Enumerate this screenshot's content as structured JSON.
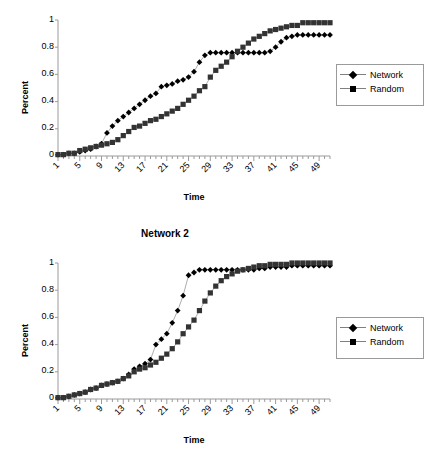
{
  "figure": {
    "background": "#ffffff",
    "caption": ""
  },
  "common": {
    "xlabel": "Time",
    "ylabel": "Percent",
    "ytick_labels": [
      "0",
      "0.2",
      "0.4",
      "0.6",
      "0.8",
      "1"
    ],
    "xtick_labels": [
      "1",
      "5",
      "9",
      "13",
      "17",
      "21",
      "25",
      "29",
      "33",
      "37",
      "41",
      "45",
      "49"
    ],
    "legend": {
      "entries": [
        {
          "label": "Network",
          "marker": "diamond",
          "color": "#000000"
        },
        {
          "label": "Random",
          "marker": "square",
          "color": "#333333"
        }
      ]
    }
  },
  "chart_data": [
    {
      "id": "chart1",
      "type": "line",
      "title": "",
      "xlabel": "Time",
      "ylabel": "Percent",
      "xlim": [
        1,
        51
      ],
      "ylim": [
        0,
        1
      ],
      "ytick_labels": [
        "0",
        "0.2",
        "0.4",
        "0.6",
        "0.8",
        "1"
      ],
      "yticks": [
        0,
        0.2,
        0.4,
        0.6,
        0.8,
        1
      ],
      "xtick_labels": [
        "1",
        "5",
        "9",
        "13",
        "17",
        "21",
        "25",
        "29",
        "33",
        "37",
        "41",
        "45",
        "49"
      ],
      "xticks": [
        1,
        5,
        9,
        13,
        17,
        21,
        25,
        29,
        33,
        37,
        41,
        45,
        49
      ],
      "grid": false,
      "legend_position": "right",
      "x": [
        1,
        2,
        3,
        4,
        5,
        6,
        7,
        8,
        9,
        10,
        11,
        12,
        13,
        14,
        15,
        16,
        17,
        18,
        19,
        20,
        21,
        22,
        23,
        24,
        25,
        26,
        27,
        28,
        29,
        30,
        31,
        32,
        33,
        34,
        35,
        36,
        37,
        38,
        39,
        40,
        41,
        42,
        43,
        44,
        45,
        46,
        47,
        48,
        49,
        50,
        51
      ],
      "series": [
        {
          "name": "Network",
          "marker": "diamond",
          "color": "#000000",
          "values": [
            0.01,
            0.01,
            0.02,
            0.02,
            0.03,
            0.04,
            0.05,
            0.07,
            0.09,
            0.17,
            0.22,
            0.26,
            0.29,
            0.32,
            0.35,
            0.38,
            0.41,
            0.44,
            0.46,
            0.51,
            0.52,
            0.53,
            0.55,
            0.56,
            0.58,
            0.62,
            0.69,
            0.74,
            0.76,
            0.76,
            0.76,
            0.76,
            0.76,
            0.76,
            0.76,
            0.76,
            0.76,
            0.76,
            0.76,
            0.77,
            0.8,
            0.84,
            0.87,
            0.88,
            0.89,
            0.89,
            0.89,
            0.89,
            0.89,
            0.89,
            0.89
          ]
        },
        {
          "name": "Random",
          "marker": "square",
          "color": "#333333",
          "values": [
            0.01,
            0.01,
            0.02,
            0.02,
            0.04,
            0.05,
            0.06,
            0.07,
            0.08,
            0.09,
            0.1,
            0.12,
            0.15,
            0.18,
            0.21,
            0.22,
            0.24,
            0.26,
            0.27,
            0.29,
            0.31,
            0.33,
            0.35,
            0.38,
            0.41,
            0.44,
            0.48,
            0.51,
            0.58,
            0.63,
            0.66,
            0.69,
            0.73,
            0.77,
            0.8,
            0.83,
            0.86,
            0.88,
            0.9,
            0.92,
            0.93,
            0.94,
            0.95,
            0.96,
            0.96,
            0.98,
            0.98,
            0.98,
            0.98,
            0.98,
            0.98
          ]
        }
      ]
    },
    {
      "id": "chart2",
      "type": "line",
      "title": "Network 2",
      "xlabel": "Time",
      "ylabel": "Percent",
      "xlim": [
        1,
        51
      ],
      "ylim": [
        0,
        1
      ],
      "ytick_labels": [
        "0",
        "0.2",
        "0.4",
        "0.6",
        "0.8",
        "1"
      ],
      "yticks": [
        0,
        0.2,
        0.4,
        0.6,
        0.8,
        1
      ],
      "xtick_labels": [
        "1",
        "5",
        "9",
        "13",
        "17",
        "21",
        "25",
        "29",
        "33",
        "37",
        "41",
        "45",
        "49"
      ],
      "xticks": [
        1,
        5,
        9,
        13,
        17,
        21,
        25,
        29,
        33,
        37,
        41,
        45,
        49
      ],
      "grid": false,
      "legend_position": "right",
      "x": [
        1,
        2,
        3,
        4,
        5,
        6,
        7,
        8,
        9,
        10,
        11,
        12,
        13,
        14,
        15,
        16,
        17,
        18,
        19,
        20,
        21,
        22,
        23,
        24,
        25,
        26,
        27,
        28,
        29,
        30,
        31,
        32,
        33,
        34,
        35,
        36,
        37,
        38,
        39,
        40,
        41,
        42,
        43,
        44,
        45,
        46,
        47,
        48,
        49,
        50,
        51
      ],
      "series": [
        {
          "name": "Network",
          "marker": "diamond",
          "color": "#000000",
          "values": [
            0.01,
            0.01,
            0.02,
            0.03,
            0.04,
            0.05,
            0.07,
            0.08,
            0.1,
            0.11,
            0.12,
            0.13,
            0.15,
            0.18,
            0.22,
            0.24,
            0.26,
            0.29,
            0.4,
            0.44,
            0.48,
            0.56,
            0.65,
            0.76,
            0.91,
            0.93,
            0.95,
            0.95,
            0.95,
            0.95,
            0.95,
            0.95,
            0.95,
            0.95,
            0.95,
            0.95,
            0.95,
            0.96,
            0.96,
            0.97,
            0.97,
            0.97,
            0.97,
            0.98,
            0.98,
            0.98,
            0.98,
            0.98,
            0.98,
            0.98,
            0.98
          ]
        },
        {
          "name": "Random",
          "marker": "square",
          "color": "#333333",
          "values": [
            0.01,
            0.01,
            0.02,
            0.03,
            0.04,
            0.05,
            0.07,
            0.08,
            0.1,
            0.11,
            0.12,
            0.13,
            0.15,
            0.17,
            0.2,
            0.22,
            0.23,
            0.25,
            0.27,
            0.3,
            0.33,
            0.37,
            0.42,
            0.48,
            0.53,
            0.58,
            0.65,
            0.72,
            0.78,
            0.83,
            0.87,
            0.9,
            0.92,
            0.94,
            0.95,
            0.96,
            0.97,
            0.98,
            0.98,
            0.99,
            0.99,
            0.99,
            0.99,
            1.0,
            1.0,
            1.0,
            1.0,
            1.0,
            1.0,
            1.0,
            1.0
          ]
        }
      ]
    }
  ]
}
